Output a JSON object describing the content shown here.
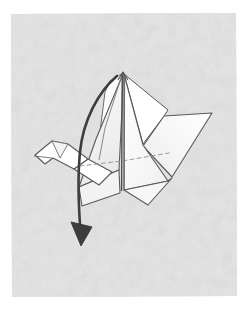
{
  "figure": {
    "instruction_type": "fold-arrow-diagram",
    "canvas": {
      "width": 250,
      "height": 314
    }
  },
  "colors": {
    "page_background": "#ffffff",
    "panel_background": "#e4e4e4",
    "panel_texture_light": "#ededed",
    "panel_texture_dark": "#d9d9d9",
    "model_fill_white": "#ffffff",
    "model_fill_shaded": "#f3f3f3",
    "model_fill_shadow": "#e8e8e8",
    "outline_stroke": "#555555",
    "outline_stroke_light": "#8a8a8a",
    "crease_dashed": "#9a9a9a",
    "arrow_stroke": "#3d3d3d",
    "spine_stroke": "#4a4a4a"
  },
  "panel": {
    "name": "textured-grey-backdrop",
    "left": 11,
    "top": 13,
    "right": 237,
    "bottom": 297
  },
  "model": {
    "name": "paper-crane",
    "parts": [
      {
        "id": "head",
        "label": "head and beak"
      },
      {
        "id": "neck",
        "label": "neck"
      },
      {
        "id": "left-wing",
        "label": "left wing"
      },
      {
        "id": "right-wing",
        "label": "right wing"
      },
      {
        "id": "body",
        "label": "body"
      },
      {
        "id": "tail",
        "label": "tail"
      },
      {
        "id": "center-spine",
        "label": "center spine ridge"
      }
    ]
  },
  "annotations": {
    "fold_arrow": {
      "name": "curved-fold-arrow",
      "description": "curved arrow sweeping from the top peak down the left side ending below the body",
      "direction": "down-left",
      "head_position": {
        "x": 80,
        "y": 246
      }
    },
    "crease_line": {
      "name": "valley-fold-crease",
      "style": "dashed",
      "description": "horizontal dashed crease across the body"
    }
  },
  "geometry": {
    "panel_path": "M11,14 L236,13 L237,296 L12,297 Z",
    "left_wing_upper": "M123,73 L110,81 L105,92 L99,140 L116,167 L121,100 Z",
    "left_wing_main": "M123,74 L96,139 L79,187 L119,170 L122,110 Z",
    "left_wing_lower": "M79,187 L119,170 L120,193 L82,206 Z",
    "body_left": "M96,139 L79,187 L82,207 L121,189 L122,140 Z",
    "right_wing_upper": "M124,74 L143,144 L164,116 L168,110 Z",
    "right_wing_blade": "M212,113 L164,116 L143,146 L172,177 Z",
    "right_body": "M124,74 L124,190 L168,181 L143,145 Z",
    "right_lower": "M124,190 L168,181 L172,178 L148,205 Z",
    "head_shape": "M35,155 L52,141 L68,144 L88,159 L74,169 L53,158 L45,164 Z",
    "head_inner": "M52,141 L68,144 L60,158 Z",
    "neck_shape": "M88,159 L74,169 L99,185 L112,172 Z",
    "spine": "M123,74 L122,190",
    "crease_dashed": "M80,166 L122,161 L169,153",
    "arrow_path": "M117,76 C98,92 83,121 80,152 C77,182 79,214 81,238",
    "arrow_head": "M81,246 L71,222 L92,227 Z"
  },
  "meta": {
    "figure_number": "",
    "caption": ""
  }
}
